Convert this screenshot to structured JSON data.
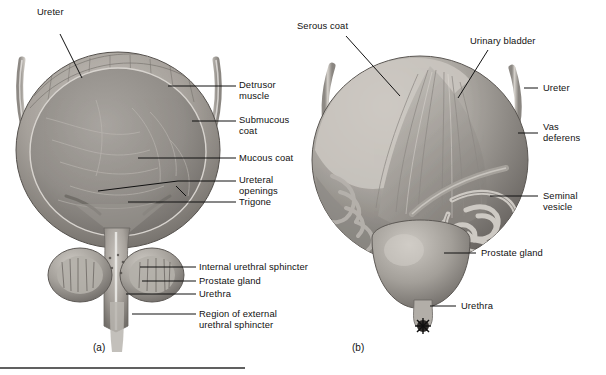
{
  "figure": {
    "type": "anatomical-illustration",
    "style": "grayscale halftone textbook plate",
    "panels": [
      {
        "id": "a",
        "caption": "(a)",
        "view": "frontal cutaway / coronal section of urinary bladder",
        "labels": [
          {
            "text": "Ureter",
            "align": "left"
          },
          {
            "text": "Detrusor\nmuscle",
            "align": "right"
          },
          {
            "text": "Submucous\ncoat",
            "align": "right"
          },
          {
            "text": "Mucous coat",
            "align": "right"
          },
          {
            "text": "Ureteral\nopenings",
            "align": "right"
          },
          {
            "text": "Trigone",
            "align": "right"
          },
          {
            "text": "Internal urethral sphincter",
            "align": "right"
          },
          {
            "text": "Prostate gland",
            "align": "right"
          },
          {
            "text": "Urethra",
            "align": "right"
          },
          {
            "text": "Region of external\nurethral sphincter",
            "align": "right"
          }
        ]
      },
      {
        "id": "b",
        "caption": "(b)",
        "view": "external posterior view of bladder, seminal vesicles and prostate",
        "labels": [
          {
            "text": "Serous coat",
            "align": "left"
          },
          {
            "text": "Urinary bladder",
            "align": "left"
          },
          {
            "text": "Ureter",
            "align": "right"
          },
          {
            "text": "Vas\ndeferens",
            "align": "right"
          },
          {
            "text": "Seminal\nvesicle",
            "align": "right"
          },
          {
            "text": "Prostate gland",
            "align": "right"
          },
          {
            "text": "Urethra",
            "align": "right"
          }
        ]
      }
    ],
    "colors": {
      "background": "#ffffff",
      "leader_line": "#111111",
      "tissue_light": "#cfcbc6",
      "tissue_mid": "#9a958f",
      "tissue_dark": "#6d6965",
      "cavity": "#8d8984",
      "rule": "#2b2b2b"
    },
    "footer_rule": {
      "present": true
    }
  }
}
